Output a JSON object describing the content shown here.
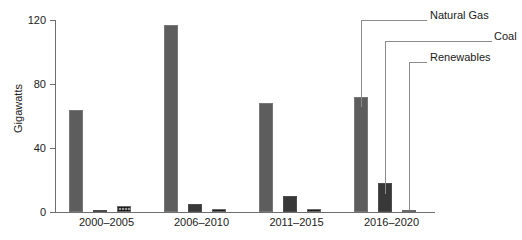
{
  "chart_data": {
    "type": "bar",
    "title": "",
    "xlabel": "",
    "ylabel": "Gigawatts",
    "ylim": [
      0,
      120
    ],
    "yticks": [
      0,
      40,
      80,
      120
    ],
    "ytick_labels": [
      "0",
      "40",
      "80",
      "120"
    ],
    "grid": false,
    "legend_position": "callout-right",
    "categories": [
      "2000–2005",
      "2006–2010",
      "2011–2015",
      "2016–2020"
    ],
    "series": [
      {
        "name": "Natural  Gas",
        "values": [
          64,
          117,
          68,
          72
        ],
        "color": "#5d5d5d"
      },
      {
        "name": "Coal",
        "values": [
          1,
          5,
          10,
          18
        ],
        "color": "#383838"
      },
      {
        "name": "Renewables",
        "values": [
          4,
          2,
          2,
          1.5
        ],
        "color": "#8a8a8a"
      }
    ],
    "annotations": [
      {
        "text": "Natural  Gas",
        "target_series": "Natural  Gas",
        "target_category": "2016–2020"
      },
      {
        "text": "Coal",
        "target_series": "Coal",
        "target_category": "2016–2020"
      },
      {
        "text": "Renewables",
        "target_series": "Renewables",
        "target_category": "2016–2020"
      }
    ]
  },
  "axis": {
    "y_title": "Gigawatts",
    "y_ticks": [
      "120",
      "80",
      "40",
      "0"
    ],
    "x_categories": [
      "2000–2005",
      "2006–2010",
      "2011–2015",
      "2016–2020"
    ]
  },
  "callouts": {
    "natural_gas": "Natural  Gas",
    "coal": "Coal",
    "renewables": "Renewables"
  }
}
